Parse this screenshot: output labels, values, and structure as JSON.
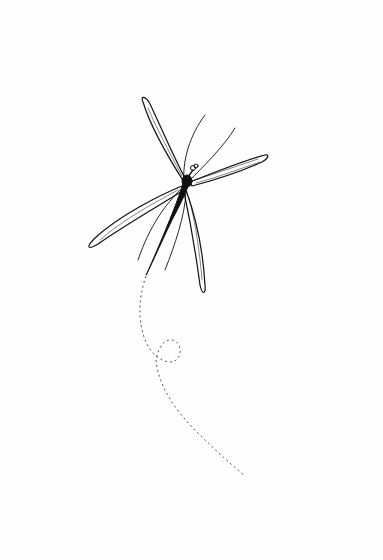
{
  "image": {
    "description": "Ink line drawing of a dragonfly in flight with a dashed looping flight path trailing below it",
    "subject": "dragonfly",
    "style": "black ink line art on white",
    "colors": {
      "background": "#ffffff",
      "ink": "#111111",
      "path": "#555555"
    }
  }
}
